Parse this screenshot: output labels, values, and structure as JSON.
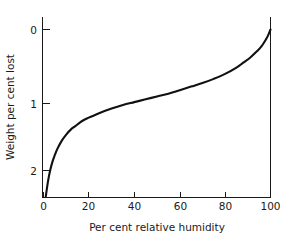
{
  "chart_data": {
    "type": "line",
    "title": "",
    "xlabel": "Per cent relative humidity",
    "ylabel": "Weight per cent lost",
    "xlim": [
      0,
      100
    ],
    "ylim": [
      0,
      2.5
    ],
    "y_axis_inverted": true,
    "grid": false,
    "legend": false,
    "xticks": [
      0,
      20,
      40,
      60,
      80,
      100
    ],
    "xtick_labels": [
      "0",
      "20",
      "40",
      "60",
      "80",
      "100"
    ],
    "yticks": [
      0,
      1,
      2
    ],
    "ytick_labels": [
      "0",
      "1",
      "2"
    ],
    "series": [
      {
        "name": "Weight per cent lost vs relative humidity",
        "color": "#111111",
        "x": [
          1,
          2,
          3,
          4,
          5,
          6,
          8,
          10,
          12,
          14,
          16,
          18,
          20,
          25,
          30,
          35,
          40,
          45,
          50,
          55,
          60,
          65,
          70,
          75,
          80,
          85,
          88,
          91,
          94,
          96,
          98,
          99,
          100
        ],
        "y": [
          2.37,
          2.15,
          1.99,
          1.87,
          1.78,
          1.7,
          1.58,
          1.49,
          1.42,
          1.37,
          1.32,
          1.28,
          1.25,
          1.18,
          1.12,
          1.07,
          1.03,
          0.99,
          0.95,
          0.91,
          0.86,
          0.81,
          0.76,
          0.7,
          0.63,
          0.54,
          0.47,
          0.4,
          0.31,
          0.24,
          0.14,
          0.08,
          0.0
        ]
      }
    ]
  },
  "axes": {
    "x_label": "Per cent relative humidity",
    "y_label": "Weight per cent lost"
  },
  "tick_labels": {
    "x": [
      "0",
      "20",
      "40",
      "60",
      "80",
      "100"
    ],
    "y": [
      "0",
      "1",
      "2"
    ]
  }
}
